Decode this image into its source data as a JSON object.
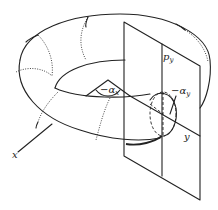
{
  "figure": {
    "type": "torus-with-cutting-plane",
    "labels": {
      "x": "x",
      "y": "y",
      "p": "p",
      "p_sub": "y",
      "alpha_x": "−α",
      "alpha_x_sub": "x",
      "alpha_y": "−α",
      "alpha_y_sub": "y"
    },
    "colors": {
      "stroke": "#222222",
      "background": "#ffffff"
    }
  }
}
